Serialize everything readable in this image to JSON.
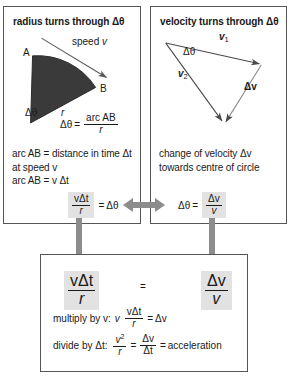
{
  "panels": {
    "left": {
      "title": "radius turns through Δθ",
      "labels": {
        "speed": "speed",
        "speed_var": "v",
        "point_a": "A",
        "point_b": "B",
        "delta_theta": "Δθ",
        "radius": "r"
      },
      "formula": {
        "lhs": "Δθ",
        "eq": "=",
        "num": "arc AB",
        "den": "r"
      },
      "note": "arc AB = distance in time Δt\nat speed v\narc AB = v Δt"
    },
    "right": {
      "title": "velocity turns through Δθ",
      "labels": {
        "v1": "v",
        "v1_sub": "1",
        "v2": "v",
        "v2_sub": "2",
        "delta_v": "Δv",
        "delta_theta": "Δθ"
      },
      "note": "change of velocity Δv\ntowards centre of circle"
    },
    "bottom": {
      "left_fraction": {
        "num": "vΔt",
        "den": "r"
      },
      "equals": "=",
      "right_fraction": {
        "num": "Δv",
        "den": "v"
      },
      "step1": {
        "prefix": "multiply by v:",
        "factor": "v",
        "num": "vΔt",
        "den": "r",
        "eq": "=",
        "result": "Δv"
      },
      "step2": {
        "prefix": "divide by Δt:",
        "lhs_num": "v",
        "lhs_exp": "2",
        "lhs_den": "r",
        "eq1": "=",
        "rhs_num": "Δv",
        "rhs_den": "Δt",
        "eq2": "=",
        "result": "acceleration"
      }
    }
  },
  "equations": {
    "left_box": {
      "num": "vΔt",
      "den": "r",
      "eq": "=",
      "rhs": "Δθ"
    },
    "right_box": {
      "lhs": "Δθ",
      "eq": "=",
      "num": "Δv",
      "den": "v"
    }
  },
  "colors": {
    "sector_fill": "#3a3a3a",
    "arrow_gray": "#8c8c8c",
    "panel_border": "#555555",
    "highlight_bg": "#e2e2e2",
    "text": "#1a1a1a"
  }
}
